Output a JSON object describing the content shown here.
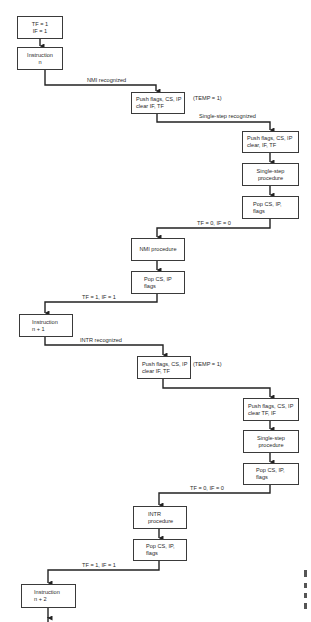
{
  "diagram": {
    "type": "flowchart",
    "nodes": {
      "n1": {
        "lines": [
          "TF = 1",
          "IF = 1"
        ]
      },
      "n2": {
        "lines": [
          "Instruction",
          "n"
        ]
      },
      "n3": {
        "lines": [
          "Push flags, CS, IP",
          "clear IF, TF"
        ]
      },
      "n4": {
        "lines": [
          "Push flags, CS, IP",
          "clear, IF, TF"
        ]
      },
      "n5": {
        "lines": [
          "Single-step",
          "procedure"
        ]
      },
      "n6": {
        "lines": [
          "Pop CS, IP,",
          "flags"
        ]
      },
      "n7": {
        "lines": [
          "NMI procedure"
        ]
      },
      "n8": {
        "lines": [
          "Pop CS, IP",
          "flags"
        ]
      },
      "n9": {
        "lines": [
          "Instruction",
          "n + 1"
        ]
      },
      "n10": {
        "lines": [
          "Push flags, CS, IP",
          "clear IF, TF"
        ]
      },
      "n11": {
        "lines": [
          "Push flags, CS, IP",
          "clear TF, IF"
        ]
      },
      "n12": {
        "lines": [
          "Single-step",
          "procedure"
        ]
      },
      "n13": {
        "lines": [
          "Pop CS, IP,",
          "flags"
        ]
      },
      "n14": {
        "lines": [
          "INTR",
          "procedure"
        ]
      },
      "n15": {
        "lines": [
          "Pop CS, IP,",
          "flags"
        ]
      },
      "n16": {
        "lines": [
          "Instruction",
          "n + 2"
        ]
      }
    },
    "labels": {
      "nmi_recognized": "NMI recognized",
      "temp1_a": "(TEMP = 1)",
      "single_step_recognized": "Single-step recognized",
      "tf0_if0_a": "TF = 0, IF = 0",
      "tf1_if1_a": "TF = 1, IF = 1",
      "intr_recognized": "INTR recognized",
      "temp1_b": "(TEMP = 1)",
      "tf0_if0_b": "TF = 0, IF = 0",
      "tf1_if1_b": "TF = 1, IF = 1"
    },
    "edges": [
      {
        "from": "n1",
        "to": "n2"
      },
      {
        "from": "n2",
        "to": "n3",
        "label": "nmi_recognized"
      },
      {
        "from": "n3",
        "to": "n4",
        "label": "single_step_recognized"
      },
      {
        "from": "n4",
        "to": "n5"
      },
      {
        "from": "n5",
        "to": "n6"
      },
      {
        "from": "n6",
        "to": "n7",
        "label": "tf0_if0_a"
      },
      {
        "from": "n7",
        "to": "n8"
      },
      {
        "from": "n8",
        "to": "n9",
        "label": "tf1_if1_a"
      },
      {
        "from": "n9",
        "to": "n10",
        "label": "intr_recognized"
      },
      {
        "from": "n10",
        "to": "n11"
      },
      {
        "from": "n11",
        "to": "n12"
      },
      {
        "from": "n12",
        "to": "n13"
      },
      {
        "from": "n13",
        "to": "n14",
        "label": "tf0_if0_b"
      },
      {
        "from": "n14",
        "to": "n15"
      },
      {
        "from": "n15",
        "to": "n16",
        "label": "tf1_if1_b"
      },
      {
        "from": "n16",
        "to": "continue"
      }
    ]
  }
}
